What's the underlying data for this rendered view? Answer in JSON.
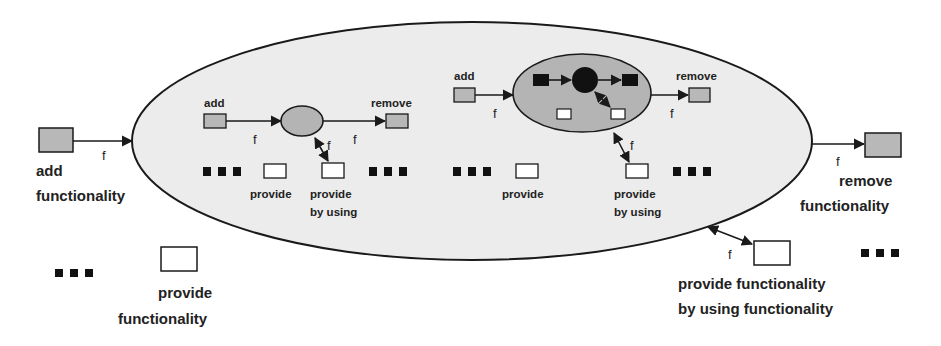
{
  "diagram": {
    "colors": {
      "outline": "#1a1a1a",
      "outer_fill": "#ececec",
      "gray_box": "#b8b8b8",
      "inner_ellipse_fill": "#b4b4b4",
      "white_box": "#ffffff",
      "black": "#111111"
    },
    "outer": {
      "add": {
        "label_line1": "add",
        "label_line2": "functionality",
        "edge_label": "f"
      },
      "remove": {
        "label_line1": "remove",
        "label_line2": "functionality",
        "edge_label": "f"
      },
      "provide": {
        "label_line1": "provide",
        "label_line2": "functionality"
      },
      "provide_by_using": {
        "label_line1": "provide functionality",
        "label_line2": "by using functionality",
        "edge_label": "f"
      },
      "ellipsis": "..."
    },
    "left_component": {
      "add_label": "add",
      "remove_label": "remove",
      "provide_label": "provide",
      "provide_by_using_line1": "provide",
      "provide_by_using_line2": "by using",
      "edge_add": "f",
      "edge_remove": "f",
      "edge_use": "f"
    },
    "right_component": {
      "add_label": "add",
      "remove_label": "remove",
      "provide_label": "provide",
      "provide_by_using_line1": "provide",
      "provide_by_using_line2": "by using",
      "edge_add": "f",
      "edge_remove": "f",
      "edge_use": "f"
    }
  }
}
